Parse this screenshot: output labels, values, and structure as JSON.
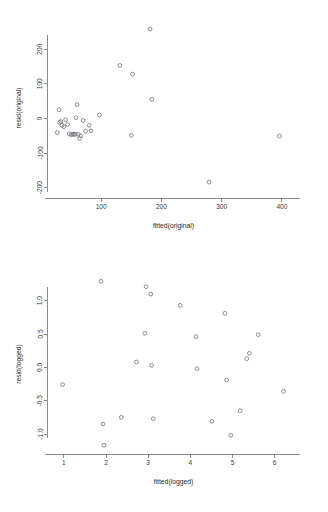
{
  "figure": {
    "type": "scatter-panel-figure",
    "panel_count": 2,
    "background": "#ffffff",
    "point_color": "#6a6a78",
    "axis_color": "#6f6f6f"
  },
  "chart_data": [
    {
      "id": "residuals-original",
      "type": "scatter",
      "title": "",
      "xlabel": "fitted(original)",
      "ylabel": "resid(original)",
      "xticks": [
        100,
        200,
        300,
        400
      ],
      "yticks": [
        200,
        100,
        0,
        -100,
        -200
      ],
      "xlim": [
        10,
        430
      ],
      "ylim": [
        -230,
        290
      ],
      "grid": false,
      "legend": null,
      "marker": "open-circle",
      "x": [
        27,
        30,
        31,
        33,
        35,
        38,
        41,
        44,
        47,
        50,
        53,
        55,
        57,
        58,
        60,
        62,
        64,
        66,
        70,
        74,
        80,
        83,
        97,
        131,
        150,
        152,
        181,
        184,
        279,
        396
      ],
      "y": [
        -41,
        25,
        -12,
        -9,
        -20,
        -24,
        -4,
        -18,
        -45,
        -47,
        -46,
        -46,
        -46,
        2,
        40,
        -46,
        -58,
        -50,
        -6,
        -37,
        -20,
        -36,
        10,
        153,
        -49,
        128,
        258,
        55,
        -184,
        -51
      ],
      "points": [
        {
          "x": 27,
          "y": -41
        },
        {
          "x": 30,
          "y": 25
        },
        {
          "x": 31,
          "y": -12
        },
        {
          "x": 33,
          "y": -9
        },
        {
          "x": 35,
          "y": -20
        },
        {
          "x": 38,
          "y": -24
        },
        {
          "x": 41,
          "y": -4
        },
        {
          "x": 44,
          "y": -18
        },
        {
          "x": 47,
          "y": -45
        },
        {
          "x": 50,
          "y": -47
        },
        {
          "x": 53,
          "y": -46
        },
        {
          "x": 55,
          "y": -46
        },
        {
          "x": 57,
          "y": -46
        },
        {
          "x": 58,
          "y": 2
        },
        {
          "x": 60,
          "y": 40
        },
        {
          "x": 62,
          "y": -46
        },
        {
          "x": 64,
          "y": -58
        },
        {
          "x": 66,
          "y": -50
        },
        {
          "x": 70,
          "y": -6
        },
        {
          "x": 74,
          "y": -37
        },
        {
          "x": 80,
          "y": -20
        },
        {
          "x": 83,
          "y": -36
        },
        {
          "x": 97,
          "y": 10
        },
        {
          "x": 131,
          "y": 153
        },
        {
          "x": 150,
          "y": -49
        },
        {
          "x": 152,
          "y": 128
        },
        {
          "x": 181,
          "y": 258
        },
        {
          "x": 184,
          "y": 55
        },
        {
          "x": 279,
          "y": -184
        },
        {
          "x": 396,
          "y": -51
        }
      ]
    },
    {
      "id": "residuals-logged",
      "type": "scatter",
      "title": "",
      "xlabel": "fitted(logged)",
      "ylabel": "resid(logged)",
      "xticks": [
        1,
        2,
        3,
        4,
        5,
        6
      ],
      "yticks": [
        1.0,
        0.5,
        0.0,
        -0.5,
        -1.0
      ],
      "xlim": [
        0.6,
        6.6
      ],
      "ylim": [
        -1.3,
        1.4
      ],
      "grid": false,
      "legend": null,
      "marker": "open-circle",
      "x": [
        0.97,
        1.88,
        1.93,
        1.95,
        2.36,
        2.72,
        2.76,
        2.92,
        2.95,
        3.06,
        3.08,
        3.12,
        3.76,
        4.13,
        4.16,
        4.18,
        4.51,
        4.82,
        4.86,
        4.96,
        5.18,
        5.34,
        5.4,
        5.61,
        6.21
      ],
      "y": [
        -0.26,
        1.29,
        -0.85,
        -1.17,
        -0.75,
        0.08,
        -0.66,
        0.51,
        1.21,
        1.1,
        0.03,
        -0.77,
        0.93,
        0.46,
        -0.02,
        -0.02,
        -0.81,
        0.81,
        -0.19,
        -1.02,
        -0.65,
        0.13,
        0.21,
        0.49,
        -0.36
      ],
      "points": [
        {
          "x": 0.97,
          "y": -0.26
        },
        {
          "x": 1.88,
          "y": 1.29
        },
        {
          "x": 1.93,
          "y": -0.85
        },
        {
          "x": 1.95,
          "y": -1.17
        },
        {
          "x": 2.36,
          "y": -0.75
        },
        {
          "x": 2.72,
          "y": 0.08
        },
        {
          "x": 2.92,
          "y": 0.51
        },
        {
          "x": 2.95,
          "y": 1.21
        },
        {
          "x": 3.06,
          "y": 1.1
        },
        {
          "x": 3.08,
          "y": 0.03
        },
        {
          "x": 3.12,
          "y": -0.77
        },
        {
          "x": 3.76,
          "y": 0.93
        },
        {
          "x": 4.13,
          "y": 0.46
        },
        {
          "x": 4.16,
          "y": -0.02
        },
        {
          "x": 4.51,
          "y": -0.81
        },
        {
          "x": 4.82,
          "y": 0.81
        },
        {
          "x": 4.86,
          "y": -0.19
        },
        {
          "x": 4.96,
          "y": -1.02
        },
        {
          "x": 5.18,
          "y": -0.65
        },
        {
          "x": 5.34,
          "y": 0.13
        },
        {
          "x": 5.4,
          "y": 0.21
        },
        {
          "x": 5.61,
          "y": 0.49
        },
        {
          "x": 6.21,
          "y": -0.36
        }
      ]
    }
  ]
}
